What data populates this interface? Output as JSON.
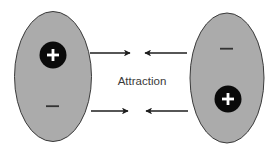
{
  "diagram": {
    "label": "Attraction",
    "colors": {
      "molecule_fill": "#ababab",
      "molecule_stroke": "#3a3a3a",
      "charge_circle": "#0a0a0a",
      "charge_sign": "#ffffff",
      "arrow": "#1e1e1e",
      "minus_sign": "#333333",
      "background": "#ffffff"
    },
    "molecules": [
      {
        "id": "left",
        "top_charge": "+",
        "bottom_charge": "−",
        "top_charge_style": "filled-circle",
        "bottom_charge_style": "bare"
      },
      {
        "id": "right",
        "top_charge": "−",
        "bottom_charge": "+",
        "top_charge_style": "bare",
        "bottom_charge_style": "filled-circle"
      }
    ],
    "arrows": [
      {
        "row": "top",
        "side": "left",
        "direction": "right"
      },
      {
        "row": "top",
        "side": "right",
        "direction": "left"
      },
      {
        "row": "bottom",
        "side": "left",
        "direction": "right"
      },
      {
        "row": "bottom",
        "side": "right",
        "direction": "left"
      }
    ]
  }
}
